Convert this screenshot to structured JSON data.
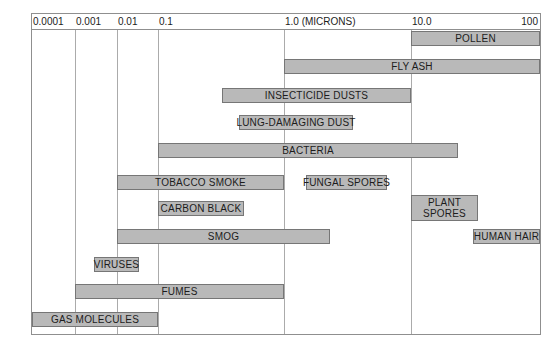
{
  "chart_data": {
    "type": "bar",
    "variant": "horizontal-range-log",
    "unit": "microns",
    "axis_label": "1.0 (MICRONS)",
    "xlim": [
      0.0001,
      100
    ],
    "grid": true,
    "legend_position": "none",
    "ticks": [
      {
        "label": "0.0001",
        "value": 0.0001,
        "align": "left"
      },
      {
        "label": "0.001",
        "value": 0.001,
        "align": "left"
      },
      {
        "label": "0.01",
        "value": 0.01,
        "align": "left"
      },
      {
        "label": "0.1",
        "value": 0.1,
        "align": "left"
      },
      {
        "label": "1.0 (MICRONS)",
        "value": 1.0,
        "align": "left"
      },
      {
        "label": "10.0",
        "value": 10.0,
        "align": "left"
      },
      {
        "label": "100",
        "value": 100.0,
        "align": "right"
      }
    ],
    "series": [
      {
        "label": "POLLEN",
        "min_microns": 10,
        "max_microns": 100,
        "row": 0
      },
      {
        "label": "FLY ASH",
        "min_microns": 1.0,
        "max_microns": 100,
        "row": 1
      },
      {
        "label": "INSECTICIDE DUSTS",
        "min_microns": 0.32,
        "max_microns": 10,
        "row": 2
      },
      {
        "label": "LUNG-DAMAGING DUST",
        "min_microns": 0.44,
        "max_microns": 3.5,
        "row": 3
      },
      {
        "label": "BACTERIA",
        "min_microns": 0.1,
        "max_microns": 23,
        "row": 4
      },
      {
        "label": "TOBACCO SMOKE",
        "min_microns": 0.01,
        "max_microns": 1.0,
        "row": 5
      },
      {
        "label": "FUNGAL SPORES",
        "min_microns": 1.5,
        "max_microns": 6.5,
        "row": 5
      },
      {
        "label": "CARBON BLACK",
        "min_microns": 0.1,
        "max_microns": 0.48,
        "row": 6
      },
      {
        "label": "PLANT SPORES",
        "min_microns": 10,
        "max_microns": 33,
        "row": 6,
        "two_line": true
      },
      {
        "label": "SMOG",
        "min_microns": 0.01,
        "max_microns": 2.3,
        "row": 7
      },
      {
        "label": "HUMAN HAIR",
        "min_microns": 30,
        "max_microns": 100,
        "row": 7
      },
      {
        "label": "VIRUSES",
        "min_microns": 0.0028,
        "max_microns": 0.035,
        "row": 8
      },
      {
        "label": "FUMES",
        "min_microns": 0.001,
        "max_microns": 1.0,
        "row": 9
      },
      {
        "label": "GAS MOLECULES",
        "min_microns": 0.0001,
        "max_microns": 0.1,
        "row": 10
      }
    ]
  },
  "colors": {
    "background": "#ffffff",
    "bar_fill": "#b9b9b9",
    "bar_border": "#767676",
    "grid_line": "#ababab",
    "frame": "#8f8f8f",
    "text": "#1c1c1c"
  }
}
